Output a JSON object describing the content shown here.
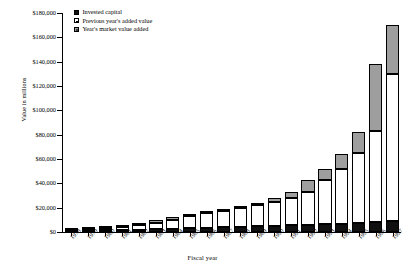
{
  "chart_data": {
    "type": "bar",
    "subtype": "stacked-bar",
    "title": "",
    "xlabel": "Fiscal year",
    "ylabel": "Value in millions",
    "ylim": [
      0,
      180000
    ],
    "ytick_step": 20000,
    "ytick_labels": [
      "$180,000",
      "$160,000",
      "$140,000",
      "$120,000",
      "$100,000",
      "$80,000",
      "$60,000",
      "$40,000",
      "$20,000",
      "$0"
    ],
    "ytick_values": [
      180000,
      160000,
      140000,
      120000,
      100000,
      80000,
      60000,
      40000,
      20000,
      0
    ],
    "grid": false,
    "legend_position": "top-left",
    "categories": [
      "1978",
      "1979",
      "1980",
      "1981",
      "1982",
      "1983",
      "1984",
      "1985",
      "1986",
      "1987",
      "1988",
      "1989",
      "1990",
      "1991",
      "1992",
      "1993",
      "1994",
      "1995",
      "1996",
      "1997"
    ],
    "series": [
      {
        "name": "Invested capital",
        "color": "#101010",
        "values": [
          1000,
          1200,
          1400,
          1600,
          1900,
          2200,
          2600,
          3000,
          3400,
          3800,
          4200,
          4600,
          5000,
          5400,
          5800,
          6200,
          6800,
          7400,
          8200,
          9000
        ]
      },
      {
        "name": "Previous year's added value",
        "color": "#ffffff",
        "values": [
          500,
          1400,
          2100,
          2600,
          3600,
          5400,
          7600,
          9800,
          12000,
          13600,
          15400,
          17200,
          19600,
          22600,
          27400,
          36600,
          45200,
          57400,
          74800,
          121000
        ]
      },
      {
        "name": "Year's market value added",
        "color": "#9e9e9e",
        "values": [
          400,
          500,
          600,
          1000,
          1800,
          2200,
          2200,
          2200,
          1600,
          1800,
          1800,
          2400,
          3000,
          4800,
          9200,
          8600,
          12200,
          17400,
          55000,
          40000
        ]
      }
    ],
    "totals": [
      1900,
      3100,
      4100,
      5200,
      7300,
      9800,
      12400,
      15000,
      17000,
      19200,
      21400,
      24200,
      27600,
      32800,
      42400,
      51400,
      64200,
      82200,
      138000,
      170000
    ]
  },
  "legend": {
    "items": [
      {
        "label": "Invested capital",
        "key": "invested"
      },
      {
        "label": "Previous year's added value",
        "key": "prev"
      },
      {
        "label": "Year's market value added",
        "key": "added"
      }
    ]
  },
  "colors": {
    "invested": "#101010",
    "previous": "#ffffff",
    "added": "#9e9e9e",
    "axis": "#000000",
    "background": "#ffffff"
  }
}
